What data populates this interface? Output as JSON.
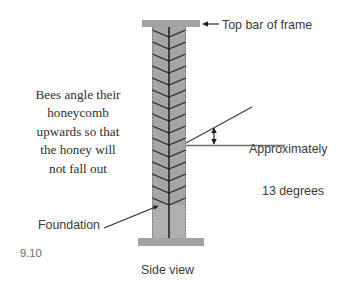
{
  "figure": {
    "number": "9.10",
    "caption": "Side view"
  },
  "annotations": {
    "top_bar": {
      "label": "Top bar of frame",
      "arrow": "left-arrow-icon"
    },
    "angle": {
      "line1": "Approximately",
      "line2": "13 degrees",
      "value": 13,
      "unit": "degrees",
      "arrow": "double-headed-vertical-arrow-icon"
    },
    "foundation": {
      "label": "Foundation",
      "arrow": "up-right-arrow-icon"
    }
  },
  "body_text": {
    "lines": [
      "Bees angle their",
      "honeycomb",
      "upwards so that",
      "the honey will",
      "not fall out"
    ]
  },
  "colors": {
    "bar_fill": "#a3a3a3",
    "comb_fill": "#9f9f9f",
    "comb_fill_light": "#b4b4b4",
    "chevron_line": "#2b2b2b",
    "foundation_line": "#1c1c1c",
    "edge_dotted": "#7d7d7d",
    "text": "#3a3a3a",
    "body_text": "#2e2e2e",
    "fignum_text": "#6a6a6a",
    "background": "#ffffff"
  },
  "geometry": {
    "comb_left": 152,
    "comb_right": 186,
    "comb_top": 27,
    "comb_bottom": 238,
    "chevron_bottom": 205,
    "top_bar": {
      "x": 142,
      "y": 20,
      "w": 58,
      "h": 7
    },
    "bottom_bar": {
      "x": 138,
      "y": 238,
      "w": 66,
      "h": 8
    },
    "center_x": 169
  }
}
